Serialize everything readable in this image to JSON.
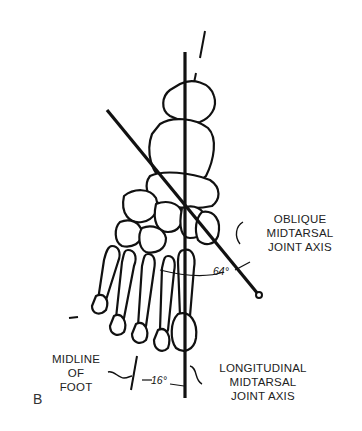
{
  "figure": {
    "panel_letter": "B",
    "labels": {
      "oblique_axis": [
        "OBLIQUE",
        "MIDTARSAL",
        "JOINT AXIS"
      ],
      "longitudinal_axis": [
        "LONGITUDINAL",
        "MIDTARSAL",
        "JOINT AXIS"
      ],
      "midline": [
        "MIDLINE",
        "OF",
        "FOOT"
      ]
    },
    "angles": {
      "oblique_to_longitudinal": "64°",
      "midline_to_longitudinal": "16°"
    },
    "colors": {
      "ink": "#111111",
      "background": "#ffffff"
    }
  }
}
